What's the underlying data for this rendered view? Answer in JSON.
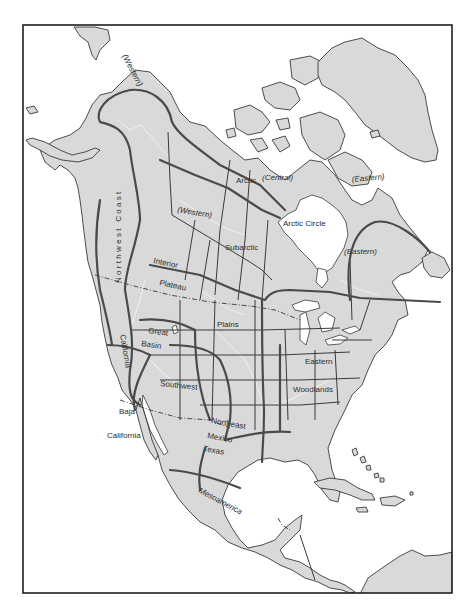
{
  "map": {
    "title": "Culture areas of North America",
    "colors": {
      "land": "#d9d9d9",
      "water": "#ffffff",
      "outline": "#3a3a3a",
      "culture_boundary": "#4a4a4a",
      "frame": "#1e1e1e"
    },
    "labels": {
      "arctic_western": "(Western)",
      "arctic": "Arctic",
      "arctic_central": "(Central)",
      "arctic_eastern": "(Eastern)",
      "arctic_circle": "Arctic Circle",
      "subarctic_western": "(Western)",
      "subarctic": "Subarctic",
      "subarctic_eastern": "(Eastern)",
      "northwest_coast": "Northwest Coast",
      "interior": "Interior",
      "plateau": "Plateau",
      "california": "California",
      "great": "Great",
      "basin": "Basin",
      "plains": "Plains",
      "southwest": "Southwest",
      "baja": "Baja",
      "baja_california": "California",
      "northeast": "Northeast",
      "mexico": "Mexico",
      "texas": "Texas",
      "eastern": "Eastern",
      "woodlands": "Woodlands",
      "mesoamerica": "Mesoamerica"
    }
  }
}
